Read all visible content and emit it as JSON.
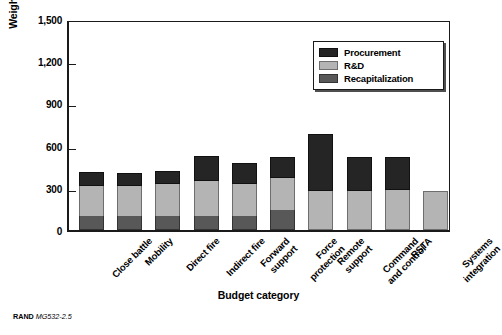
{
  "figure": {
    "footer_mark": "RAND",
    "footer_id": "MG532-2.5"
  },
  "chart_data": {
    "type": "bar",
    "stacked": true,
    "title": "",
    "xlabel": "Budget category",
    "ylabel": "Weighted shaping and hedging actions",
    "ylim": [
      0,
      1500
    ],
    "yticks": [
      0,
      300,
      600,
      900,
      1200,
      1500
    ],
    "ytick_labels": [
      "0",
      "300",
      "600",
      "900",
      "1,200",
      "1,500"
    ],
    "grid": false,
    "legend_position": "upper right",
    "categories": [
      "Close battle",
      "Mobility",
      "Direct fire",
      "Indirect fire",
      "Forward support",
      "Force protection",
      "Remote support",
      "Command and control",
      "RSTA",
      "Systems integration"
    ],
    "category_labels": [
      [
        "Close battle"
      ],
      [
        "Mobility"
      ],
      [
        "Direct fire"
      ],
      [
        "Indirect fire"
      ],
      [
        "Forward",
        "support"
      ],
      [
        "Force",
        "protection"
      ],
      [
        "Remote",
        "support"
      ],
      [
        "Command",
        "and control"
      ],
      [
        "RSTA"
      ],
      [
        "Systems",
        "integration"
      ]
    ],
    "series": [
      {
        "name": "Recapitalization",
        "color": "#585858",
        "values": [
          100,
          100,
          100,
          100,
          100,
          140,
          0,
          0,
          0,
          0
        ]
      },
      {
        "name": "R&D",
        "color": "#b4b4b4",
        "values": [
          215,
          215,
          230,
          250,
          230,
          230,
          280,
          280,
          285,
          280
        ]
      },
      {
        "name": "Procurement",
        "color": "#252525",
        "values": [
          100,
          90,
          90,
          175,
          145,
          150,
          400,
          240,
          235,
          0
        ]
      }
    ],
    "totals": [
      415,
      405,
      420,
      525,
      475,
      520,
      680,
      520,
      520,
      280
    ],
    "legend_order": [
      "Procurement",
      "R&D",
      "Recapitalization"
    ]
  }
}
